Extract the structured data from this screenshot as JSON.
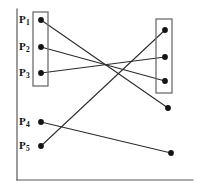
{
  "figure": {
    "width": 198,
    "height": 193,
    "background_color": "#ffffff"
  },
  "style": {
    "axis_color": "#5a5a5a",
    "box_color": "#6e6e6e",
    "edge_color": "#2b2b2b",
    "dot_color": "#141414",
    "label_color": "#111111"
  },
  "axes": {
    "y_axis": {
      "x1": 17,
      "y1": 9,
      "x2": 17,
      "y2": 180
    },
    "x_axis": {
      "x1": 17,
      "y1": 180,
      "x2": 193,
      "y2": 180
    }
  },
  "cluster_boxes": [
    {
      "id": "left-cluster",
      "x": 33,
      "y": 12,
      "width": 15,
      "height": 74,
      "label": "left cluster"
    },
    {
      "id": "right-cluster",
      "x": 156,
      "y": 19,
      "width": 16,
      "height": 74,
      "label": "right cluster"
    }
  ],
  "left_points": [
    {
      "id": "P1",
      "label": "P",
      "subscript": "1",
      "x": 41,
      "y": 20,
      "label_x": 19,
      "label_y": 14,
      "in_box": true
    },
    {
      "id": "P2",
      "label": "P",
      "subscript": "2",
      "x": 41,
      "y": 47,
      "label_x": 19,
      "label_y": 41,
      "in_box": true
    },
    {
      "id": "P3",
      "label": "P",
      "subscript": "3",
      "x": 41,
      "y": 73,
      "label_x": 19,
      "label_y": 67,
      "in_box": true
    },
    {
      "id": "P4",
      "label": "P",
      "subscript": "4",
      "x": 41,
      "y": 122,
      "label_x": 19,
      "label_y": 116,
      "in_box": false
    },
    {
      "id": "P5",
      "label": "P",
      "subscript": "5",
      "x": 41,
      "y": 146,
      "label_x": 19,
      "label_y": 140,
      "in_box": false
    }
  ],
  "right_points": [
    {
      "id": "R1",
      "x": 165,
      "y": 30,
      "in_box": true
    },
    {
      "id": "R2",
      "x": 165,
      "y": 57,
      "in_box": true
    },
    {
      "id": "R3",
      "x": 165,
      "y": 81,
      "in_box": true
    },
    {
      "id": "R4",
      "x": 168,
      "y": 108,
      "in_box": false
    },
    {
      "id": "R5",
      "x": 171,
      "y": 153,
      "in_box": false
    }
  ],
  "edges": [
    {
      "id": "edge-p1-r4",
      "from": "P1",
      "to": "R4"
    },
    {
      "id": "edge-p2-r3",
      "from": "P2",
      "to": "R3"
    },
    {
      "id": "edge-p3-r2",
      "from": "P3",
      "to": "R2"
    },
    {
      "id": "edge-p4-r5",
      "from": "P4",
      "to": "R5"
    },
    {
      "id": "edge-p5-r1",
      "from": "P5",
      "to": "R1"
    }
  ],
  "geometry": {
    "dot_radius": 2.9,
    "edge_width": 1.05
  }
}
